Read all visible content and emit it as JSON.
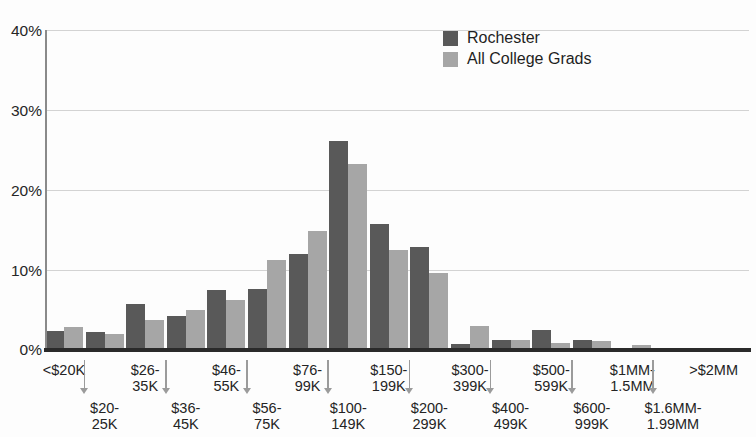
{
  "chart_data": {
    "type": "bar",
    "title": "",
    "xlabel": "",
    "ylabel": "",
    "ylim": [
      0,
      40
    ],
    "yticks": [
      "0%",
      "10%",
      "20%",
      "30%",
      "40%"
    ],
    "ytick_values": [
      0,
      10,
      20,
      30,
      40
    ],
    "grid": true,
    "legend_position": "top-right",
    "categories": [
      "<$20K",
      "$20-25K",
      "$26-35K",
      "$36-45K",
      "$46-55K",
      "$56-75K",
      "$76-99K",
      "$100-149K",
      "$150-199K",
      "$200-299K",
      "$300-399K",
      "$400-499K",
      "$500-599K",
      "$600-999K",
      "$1MM-1.5MM",
      "$1.6MM-1.99MM",
      ">$2MM"
    ],
    "category_labels": [
      {
        "row": "top",
        "line1": "<$20K",
        "line2": ""
      },
      {
        "row": "bot",
        "line1": "$20-",
        "line2": "25K"
      },
      {
        "row": "top",
        "line1": "$26-",
        "line2": "35K"
      },
      {
        "row": "bot",
        "line1": "$36-",
        "line2": "45K"
      },
      {
        "row": "top",
        "line1": "$46-",
        "line2": "55K"
      },
      {
        "row": "bot",
        "line1": "$56-",
        "line2": "75K"
      },
      {
        "row": "top",
        "line1": "$76-",
        "line2": "99K"
      },
      {
        "row": "bot",
        "line1": "$100-",
        "line2": "149K"
      },
      {
        "row": "top",
        "line1": "$150-",
        "line2": "199K"
      },
      {
        "row": "bot",
        "line1": "$200-",
        "line2": "299K"
      },
      {
        "row": "top",
        "line1": "$300-",
        "line2": "399K"
      },
      {
        "row": "bot",
        "line1": "$400-",
        "line2": "499K"
      },
      {
        "row": "top",
        "line1": "$500-",
        "line2": "599K"
      },
      {
        "row": "bot",
        "line1": "$600-",
        "line2": "999K"
      },
      {
        "row": "top",
        "line1": "$1MM-",
        "line2": "1.5MM"
      },
      {
        "row": "bot",
        "line1": "$1.6MM-",
        "line2": "1.99MM"
      },
      {
        "row": "top",
        "line1": ">$2MM",
        "line2": ""
      }
    ],
    "series": [
      {
        "name": "Rochester",
        "color": "#595959",
        "values": [
          2.4,
          2.3,
          5.7,
          4.2,
          7.5,
          7.6,
          12.0,
          26.1,
          15.7,
          12.9,
          0.7,
          1.3,
          2.5,
          1.3,
          0.3,
          0.2,
          0.1
        ]
      },
      {
        "name": "All College Grads",
        "color": "#a6a6a6",
        "values": [
          2.9,
          2.0,
          3.8,
          5.0,
          6.2,
          11.3,
          14.9,
          23.2,
          12.5,
          9.6,
          3.0,
          1.3,
          0.9,
          1.1,
          0.6,
          0.2,
          0.1
        ]
      }
    ]
  },
  "legend": {
    "items": [
      {
        "label": "Rochester",
        "color": "#595959"
      },
      {
        "label": "All College Grads",
        "color": "#a6a6a6"
      }
    ]
  },
  "colors": {
    "series_dark": "#595959",
    "series_light": "#a6a6a6",
    "gridline": "#d3d3d3",
    "axis": "#2a2a2a",
    "text": "#242424"
  }
}
